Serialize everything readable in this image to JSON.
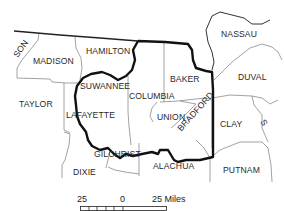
{
  "map": {
    "type": "county reference map",
    "counties": [
      {
        "name": "MADISON",
        "x": 33,
        "y": 57
      },
      {
        "name": "HAMILTON",
        "x": 86,
        "y": 47
      },
      {
        "name": "NASSAU",
        "x": 221,
        "y": 30
      },
      {
        "name": "DUVAL",
        "x": 238,
        "y": 73
      },
      {
        "name": "BAKER",
        "x": 170,
        "y": 75
      },
      {
        "name": "SUWANNEE",
        "x": 80,
        "y": 82
      },
      {
        "name": "COLUMBIA",
        "x": 129,
        "y": 92
      },
      {
        "name": "TAYLOR",
        "x": 19,
        "y": 100
      },
      {
        "name": "LAFAYETTE",
        "x": 66,
        "y": 111
      },
      {
        "name": "UNION",
        "x": 157,
        "y": 113
      },
      {
        "name": "BRADFORD",
        "x": 179,
        "y": 123,
        "rotation": -48
      },
      {
        "name": "CLAY",
        "x": 220,
        "y": 120
      },
      {
        "name": "GILCHRIST",
        "x": 94,
        "y": 150
      },
      {
        "name": "DIXIE",
        "x": 73,
        "y": 168
      },
      {
        "name": "ALACHUA",
        "x": 153,
        "y": 162
      },
      {
        "name": "PUTNAM",
        "x": 223,
        "y": 166
      }
    ],
    "partial_labels": [
      {
        "text": "SON",
        "x": 14,
        "y": 43,
        "rotation": -55
      },
      {
        "text": "S",
        "x": 267,
        "y": 119,
        "rotation": 60
      }
    ],
    "scale_bar": {
      "left_label": "25",
      "center_label": "0",
      "right_label": "25 Miles"
    },
    "colors": {
      "background": "#ffffff",
      "county_boundary": "#8a8a8a",
      "study_area_boundary": "#111111",
      "text": "#2a2a2a"
    }
  }
}
